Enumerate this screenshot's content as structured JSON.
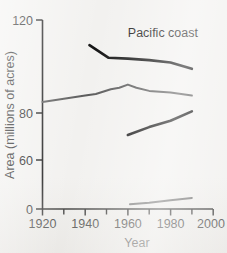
{
  "figure": {
    "panel_label": "Pacific coast",
    "background_color": "#f2f1ef"
  },
  "chart_data": {
    "type": "line",
    "title": "Pacific coast",
    "xlabel": "Year",
    "ylabel": "Area (millions of acres)",
    "xlim": [
      1920,
      2000
    ],
    "ylim": [
      0,
      120
    ],
    "xticks": [
      1920,
      1940,
      1960,
      1980,
      2000
    ],
    "xtick_labels": [
      "1920",
      "1940",
      "1960",
      "1980",
      "2000"
    ],
    "xminor_ticks": [
      1930,
      1950,
      1970,
      1990
    ],
    "yticks": [
      0,
      60,
      80,
      120
    ],
    "ytick_labels": [
      "0",
      "60",
      "80",
      "120"
    ],
    "grid": false,
    "legend": false,
    "axis_note": "y axis tick labels are 0, 60, 80, 120 only; spacing is linear",
    "series": [
      {
        "name": "upper-black-line",
        "color": "#141414",
        "width": 2.6,
        "x": [
          1942,
          1951,
          1960,
          1970,
          1980,
          1990
        ],
        "values": [
          104,
          96,
          95.5,
          94.5,
          93,
          89
        ]
      },
      {
        "name": "upper-gray-line",
        "color": "#5b5b5b",
        "width": 2.0,
        "x": [
          1920,
          1930,
          1940,
          1945,
          1952,
          1956,
          1960,
          1964,
          1970,
          1980,
          1990
        ],
        "values": [
          68,
          70,
          72,
          73,
          76,
          77,
          79,
          77,
          75,
          74,
          72
        ]
      },
      {
        "name": "lower-black-line",
        "color": "#141414",
        "width": 2.6,
        "x": [
          1960,
          1970,
          1980,
          1990
        ],
        "values": [
          47,
          52,
          56,
          62
        ]
      },
      {
        "name": "lower-gray-line",
        "color": "#6a6a6a",
        "width": 2.0,
        "x": [
          1961,
          1970,
          1980,
          1990
        ],
        "values": [
          3,
          4,
          5.5,
          7
        ]
      }
    ]
  },
  "axis": {
    "y_title": "Area (millions of acres)",
    "x_title": "Year",
    "y_labels": {
      "t0": "0",
      "t60": "60",
      "t80": "80",
      "t120": "120"
    },
    "x_labels": {
      "t1920": "1920",
      "t1940": "1940",
      "t1960": "1960",
      "t1980": "1980",
      "t2000": "2000"
    }
  }
}
